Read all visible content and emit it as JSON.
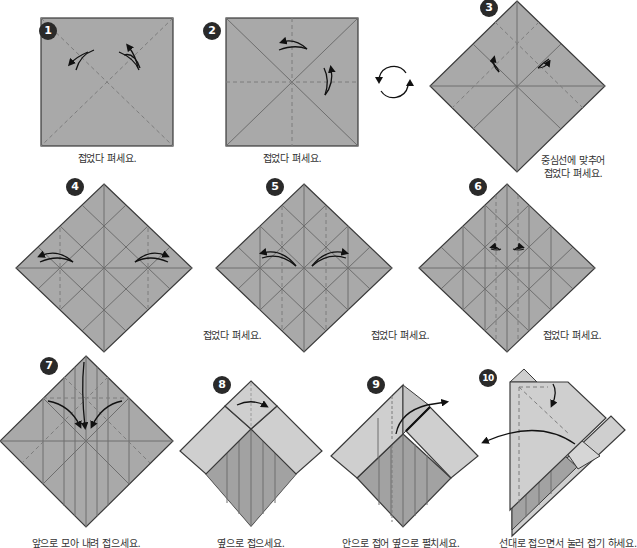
{
  "colors": {
    "paper": "#a9a9a9",
    "paper_light": "#cfcfcf",
    "paper_dark": "#9a9a9a",
    "edge": "#3a3a3a",
    "crease": "#6e6e6e",
    "valley_dash": "#7d7d7d",
    "arrow": "#111111",
    "badge_bg": "#2a2a2a",
    "badge_text": "#ffffff",
    "caption": "#333333"
  },
  "steps": [
    {
      "number": "1",
      "caption": "접었다 펴세요."
    },
    {
      "number": "2",
      "caption": "접었다 펴세요."
    },
    {
      "number": "3",
      "caption_line1": "중심선에 맞추어",
      "caption_line2": "접었다 펴세요."
    },
    {
      "number": "4",
      "caption": "접었다 펴세요."
    },
    {
      "number": "5",
      "caption": "접었다 펴세요."
    },
    {
      "number": "6",
      "caption": "접었다 펴세요."
    },
    {
      "number": "7",
      "caption": "앞으로 모아 내려 접으세요."
    },
    {
      "number": "8",
      "caption": "옆으로 접으세요."
    },
    {
      "number": "9",
      "caption": "안으로 접어 옆으로 펼치세요."
    },
    {
      "number": "10",
      "caption": "선대로 접으면서 눌러 접기 하세요."
    }
  ],
  "symbols": {
    "rotate": "turn-over-icon"
  }
}
